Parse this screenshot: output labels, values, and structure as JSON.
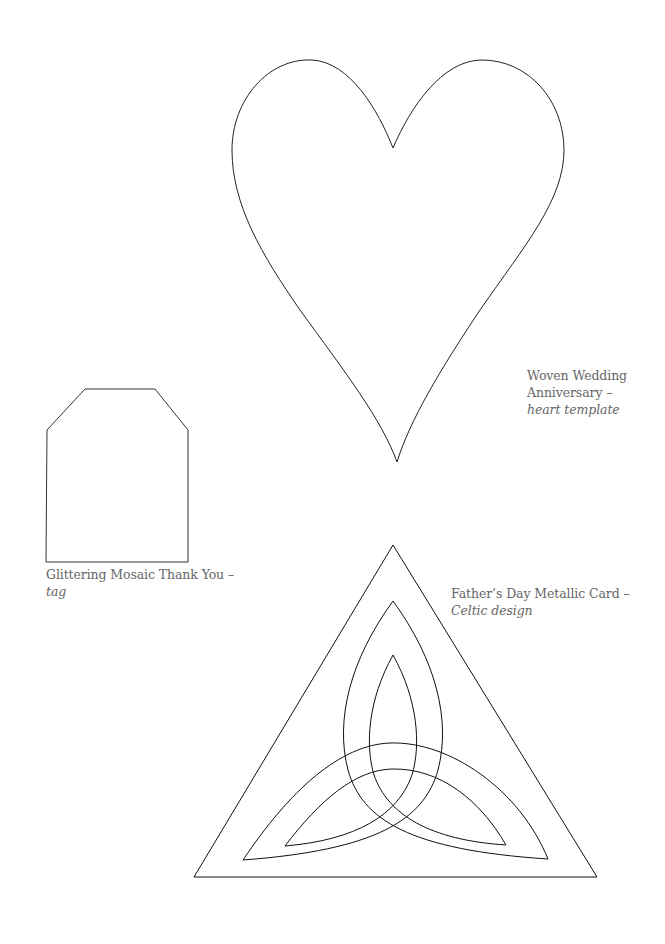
{
  "templates": {
    "heart": {
      "title": "Woven Wedding Anniversary –",
      "subtitle": "heart template"
    },
    "tag": {
      "title": "Glittering Mosaic Thank You –",
      "subtitle": "tag"
    },
    "celtic": {
      "title": "Father’s Day Metallic Card –",
      "subtitle": "Celtic design"
    }
  },
  "colors": {
    "outline": "#222222",
    "caption_text": "#666666",
    "background": "#ffffff"
  }
}
